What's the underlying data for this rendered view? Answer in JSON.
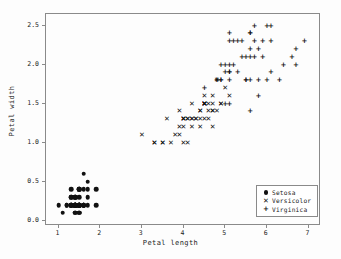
{
  "chart_data": {
    "type": "scatter",
    "title": "",
    "xlabel": "Petal length",
    "ylabel": "Petal width",
    "xlim": [
      0.7,
      7.3
    ],
    "ylim": [
      -0.07,
      2.65
    ],
    "xticks": [
      1,
      2,
      3,
      4,
      5,
      6,
      7
    ],
    "xticklabels": [
      "1",
      "2",
      "3",
      "4",
      "5",
      "6",
      "7"
    ],
    "yticks": [
      0.0,
      0.5,
      1.0,
      1.5,
      2.0,
      2.5
    ],
    "yticklabels": [
      "0.0",
      "0.5",
      "1.0",
      "1.5",
      "2.0",
      "2.5"
    ],
    "grid": false,
    "legend_position": "lower right",
    "marker_color": "#111111",
    "frame_color": "#8a8a8a",
    "background": "#fdfdfd",
    "series": [
      {
        "name": "Setosa",
        "marker": "circle",
        "marker_glyph": "●",
        "points": [
          [
            1.4,
            0.2
          ],
          [
            1.4,
            0.2
          ],
          [
            1.3,
            0.2
          ],
          [
            1.5,
            0.2
          ],
          [
            1.4,
            0.2
          ],
          [
            1.7,
            0.4
          ],
          [
            1.4,
            0.3
          ],
          [
            1.5,
            0.2
          ],
          [
            1.4,
            0.2
          ],
          [
            1.5,
            0.1
          ],
          [
            1.5,
            0.2
          ],
          [
            1.6,
            0.2
          ],
          [
            1.4,
            0.1
          ],
          [
            1.1,
            0.1
          ],
          [
            1.2,
            0.2
          ],
          [
            1.5,
            0.4
          ],
          [
            1.3,
            0.4
          ],
          [
            1.4,
            0.3
          ],
          [
            1.7,
            0.3
          ],
          [
            1.5,
            0.3
          ],
          [
            1.7,
            0.2
          ],
          [
            1.5,
            0.4
          ],
          [
            1.0,
            0.2
          ],
          [
            1.7,
            0.5
          ],
          [
            1.9,
            0.2
          ],
          [
            1.6,
            0.2
          ],
          [
            1.6,
            0.4
          ],
          [
            1.5,
            0.2
          ],
          [
            1.4,
            0.2
          ],
          [
            1.6,
            0.2
          ],
          [
            1.6,
            0.2
          ],
          [
            1.5,
            0.4
          ],
          [
            1.5,
            0.1
          ],
          [
            1.4,
            0.2
          ],
          [
            1.5,
            0.2
          ],
          [
            1.2,
            0.2
          ],
          [
            1.3,
            0.2
          ],
          [
            1.4,
            0.1
          ],
          [
            1.3,
            0.2
          ],
          [
            1.5,
            0.2
          ],
          [
            1.3,
            0.3
          ],
          [
            1.3,
            0.3
          ],
          [
            1.3,
            0.2
          ],
          [
            1.6,
            0.6
          ],
          [
            1.9,
            0.4
          ],
          [
            1.4,
            0.3
          ],
          [
            1.6,
            0.2
          ],
          [
            1.4,
            0.2
          ],
          [
            1.5,
            0.2
          ],
          [
            1.4,
            0.2
          ]
        ]
      },
      {
        "name": "Versicolor",
        "marker": "x",
        "marker_glyph": "✕",
        "points": [
          [
            4.7,
            1.4
          ],
          [
            4.5,
            1.5
          ],
          [
            4.9,
            1.5
          ],
          [
            4.0,
            1.3
          ],
          [
            4.6,
            1.5
          ],
          [
            4.5,
            1.3
          ],
          [
            4.7,
            1.6
          ],
          [
            3.3,
            1.0
          ],
          [
            4.6,
            1.3
          ],
          [
            3.9,
            1.4
          ],
          [
            3.5,
            1.0
          ],
          [
            4.2,
            1.5
          ],
          [
            4.0,
            1.0
          ],
          [
            4.7,
            1.4
          ],
          [
            3.6,
            1.3
          ],
          [
            4.4,
            1.4
          ],
          [
            4.5,
            1.5
          ],
          [
            4.1,
            1.0
          ],
          [
            4.5,
            1.5
          ],
          [
            3.9,
            1.1
          ],
          [
            4.8,
            1.8
          ],
          [
            4.0,
            1.3
          ],
          [
            4.9,
            1.5
          ],
          [
            4.7,
            1.2
          ],
          [
            4.3,
            1.3
          ],
          [
            4.4,
            1.4
          ],
          [
            4.8,
            1.4
          ],
          [
            5.0,
            1.7
          ],
          [
            4.5,
            1.5
          ],
          [
            3.5,
            1.0
          ],
          [
            3.8,
            1.1
          ],
          [
            3.7,
            1.0
          ],
          [
            3.9,
            1.2
          ],
          [
            5.1,
            1.6
          ],
          [
            4.5,
            1.5
          ],
          [
            4.5,
            1.6
          ],
          [
            4.7,
            1.5
          ],
          [
            4.4,
            1.3
          ],
          [
            4.1,
            1.3
          ],
          [
            4.0,
            1.3
          ],
          [
            4.4,
            1.2
          ],
          [
            4.6,
            1.4
          ],
          [
            4.0,
            1.2
          ],
          [
            3.3,
            1.0
          ],
          [
            4.2,
            1.3
          ],
          [
            4.2,
            1.2
          ],
          [
            4.2,
            1.3
          ],
          [
            4.3,
            1.3
          ],
          [
            3.0,
            1.1
          ],
          [
            4.1,
            1.3
          ]
        ]
      },
      {
        "name": "Virginica",
        "marker": "plus",
        "marker_glyph": "+",
        "points": [
          [
            6.0,
            2.5
          ],
          [
            5.1,
            1.9
          ],
          [
            5.9,
            2.1
          ],
          [
            5.6,
            1.8
          ],
          [
            5.8,
            2.2
          ],
          [
            6.6,
            2.1
          ],
          [
            4.5,
            1.7
          ],
          [
            6.3,
            1.8
          ],
          [
            5.8,
            1.8
          ],
          [
            6.1,
            2.5
          ],
          [
            5.1,
            2.0
          ],
          [
            5.3,
            1.9
          ],
          [
            5.5,
            2.1
          ],
          [
            5.0,
            2.0
          ],
          [
            5.1,
            2.4
          ],
          [
            5.3,
            2.3
          ],
          [
            5.5,
            1.8
          ],
          [
            6.7,
            2.2
          ],
          [
            6.9,
            2.3
          ],
          [
            5.0,
            1.5
          ],
          [
            5.7,
            2.3
          ],
          [
            4.9,
            2.0
          ],
          [
            6.7,
            2.0
          ],
          [
            4.9,
            1.8
          ],
          [
            5.7,
            2.1
          ],
          [
            6.0,
            1.8
          ],
          [
            4.8,
            1.8
          ],
          [
            4.9,
            1.8
          ],
          [
            5.6,
            2.1
          ],
          [
            5.8,
            1.6
          ],
          [
            6.1,
            1.9
          ],
          [
            6.4,
            2.0
          ],
          [
            5.6,
            2.2
          ],
          [
            5.1,
            1.5
          ],
          [
            5.6,
            1.4
          ],
          [
            6.1,
            2.3
          ],
          [
            5.6,
            2.4
          ],
          [
            5.5,
            1.8
          ],
          [
            4.8,
            1.8
          ],
          [
            5.4,
            2.1
          ],
          [
            5.6,
            2.4
          ],
          [
            5.1,
            2.3
          ],
          [
            5.1,
            1.9
          ],
          [
            5.9,
            2.3
          ],
          [
            5.7,
            2.5
          ],
          [
            5.2,
            2.3
          ],
          [
            5.0,
            1.9
          ],
          [
            5.2,
            2.0
          ],
          [
            5.4,
            2.3
          ],
          [
            5.1,
            1.8
          ]
        ]
      }
    ]
  },
  "legend": {
    "items": [
      {
        "label": "Setosa",
        "marker": "●"
      },
      {
        "label": "Versicolor",
        "marker": "✕"
      },
      {
        "label": "Virginica",
        "marker": "+"
      }
    ]
  }
}
